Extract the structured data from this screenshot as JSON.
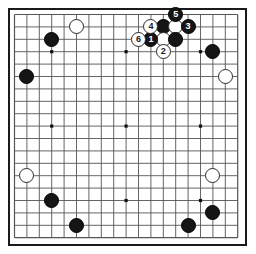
{
  "diagram": {
    "kind": "go-board-diagram",
    "board_size": 19,
    "colors": {
      "board_background": "#ffffff",
      "grid_line": "#555555",
      "border": "#1a1a1a",
      "black_stone": "#151515",
      "white_stone": "#ffffff",
      "white_stone_outline": "#2b2b2b",
      "black_label_text": "#ffffff",
      "white_label_text": "#1a1a1a"
    },
    "geometry": {
      "origin_x": 14.5,
      "origin_y": 14.5,
      "spacing": 12.4,
      "stone_diameter": 15,
      "frame_left": 8,
      "frame_top": 8,
      "frame_width": 239,
      "frame_height": 238
    },
    "star_points": [
      {
        "col": 3,
        "row": 3
      },
      {
        "col": 9,
        "row": 3
      },
      {
        "col": 15,
        "row": 3
      },
      {
        "col": 3,
        "row": 9
      },
      {
        "col": 9,
        "row": 9
      },
      {
        "col": 15,
        "row": 9
      },
      {
        "col": 3,
        "row": 15
      },
      {
        "col": 9,
        "row": 15
      },
      {
        "col": 15,
        "row": 15
      }
    ],
    "stones": [
      {
        "id": "b-upper-left-3-2",
        "color": "black",
        "col": 3,
        "row": 2,
        "label": ""
      },
      {
        "id": "w-upper-left-5-1",
        "color": "white",
        "col": 5,
        "row": 1,
        "label": ""
      },
      {
        "id": "b-left-1-5",
        "color": "black",
        "col": 1,
        "row": 5,
        "label": ""
      },
      {
        "id": "b-top-12-1",
        "color": "black",
        "col": 12,
        "row": 1,
        "label": ""
      },
      {
        "id": "w-top-13-1",
        "color": "white",
        "col": 13,
        "row": 1,
        "label": ""
      },
      {
        "id": "w-top-12-2",
        "color": "white",
        "col": 12,
        "row": 2,
        "label": ""
      },
      {
        "id": "b-top-13-2",
        "color": "black",
        "col": 13,
        "row": 2,
        "label": ""
      },
      {
        "id": "b-upper-right-16-3",
        "color": "black",
        "col": 16,
        "row": 3,
        "label": ""
      },
      {
        "id": "w-upper-right-17-5",
        "color": "white",
        "col": 17,
        "row": 5,
        "label": ""
      },
      {
        "id": "w-right-16-13",
        "color": "white",
        "col": 16,
        "row": 13,
        "label": ""
      },
      {
        "id": "w-left-1-13",
        "color": "white",
        "col": 1,
        "row": 13,
        "label": ""
      },
      {
        "id": "b-lower-left-3-15",
        "color": "black",
        "col": 3,
        "row": 15,
        "label": ""
      },
      {
        "id": "b-bottom-5-17",
        "color": "black",
        "col": 5,
        "row": 17,
        "label": ""
      },
      {
        "id": "b-bottom-14-17",
        "color": "black",
        "col": 14,
        "row": 17,
        "label": ""
      },
      {
        "id": "b-lower-right-16-16",
        "color": "black",
        "col": 16,
        "row": 16,
        "label": ""
      },
      {
        "id": "move-1",
        "color": "black",
        "col": 11,
        "row": 2,
        "label": "1"
      },
      {
        "id": "move-2",
        "color": "white",
        "col": 12,
        "row": 3,
        "label": "2"
      },
      {
        "id": "move-3",
        "color": "black",
        "col": 14,
        "row": 1,
        "label": "3"
      },
      {
        "id": "move-4",
        "color": "white",
        "col": 11,
        "row": 1,
        "label": "4"
      },
      {
        "id": "move-5",
        "color": "black",
        "col": 13,
        "row": 0,
        "label": "5"
      },
      {
        "id": "move-6",
        "color": "white",
        "col": 10,
        "row": 2,
        "label": "6"
      }
    ]
  }
}
